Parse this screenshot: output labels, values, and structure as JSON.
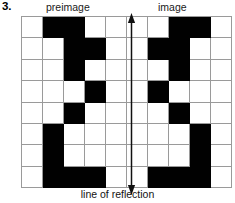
{
  "header": {
    "problem_number": "3.",
    "left_label": "preimage",
    "right_label": "image"
  },
  "caption": "line of reflection",
  "colors": {
    "filled_cell": "#010101",
    "empty_cell": "#ffffff",
    "grid_line": "#9a9a9a",
    "axis_line": "#111111",
    "background": "#ffffff"
  },
  "axis": {
    "orientation": "vertical",
    "double_headed": true,
    "position_between_columns": [
      5,
      6
    ]
  },
  "chart_data": {
    "type": "heatmap",
    "title": "line of reflection",
    "xlabel": "",
    "ylabel": "",
    "columns": 10,
    "rows": 8,
    "legend": [
      "preimage",
      "image"
    ],
    "annotations": [
      "preimage",
      "image",
      "line of reflection"
    ],
    "grid": true,
    "value_map": {
      "0": "empty",
      "1": "filled"
    },
    "values": [
      [
        0,
        1,
        1,
        0,
        0,
        0,
        0,
        1,
        1,
        0
      ],
      [
        0,
        0,
        1,
        1,
        0,
        0,
        1,
        1,
        0,
        0
      ],
      [
        0,
        0,
        1,
        0,
        0,
        0,
        0,
        1,
        0,
        0
      ],
      [
        0,
        0,
        0,
        1,
        0,
        0,
        1,
        0,
        0,
        0
      ],
      [
        0,
        0,
        1,
        0,
        0,
        0,
        0,
        1,
        0,
        0
      ],
      [
        0,
        1,
        0,
        0,
        0,
        0,
        0,
        0,
        1,
        0
      ],
      [
        0,
        1,
        0,
        0,
        0,
        0,
        0,
        0,
        1,
        0
      ],
      [
        0,
        1,
        1,
        1,
        0,
        0,
        1,
        1,
        1,
        0
      ]
    ],
    "preimage_filled_cells": [
      {
        "row": 1,
        "cols": [
          2,
          3
        ]
      },
      {
        "row": 2,
        "cols": [
          3,
          4
        ]
      },
      {
        "row": 3,
        "cols": [
          3
        ]
      },
      {
        "row": 4,
        "cols": [
          4
        ]
      },
      {
        "row": 5,
        "cols": [
          3
        ]
      },
      {
        "row": 6,
        "cols": [
          2
        ]
      },
      {
        "row": 7,
        "cols": [
          2
        ]
      },
      {
        "row": 8,
        "cols": [
          2,
          3,
          4
        ]
      }
    ],
    "image_filled_cells": [
      {
        "row": 1,
        "cols": [
          8,
          9
        ]
      },
      {
        "row": 2,
        "cols": [
          7,
          8
        ]
      },
      {
        "row": 3,
        "cols": [
          8
        ]
      },
      {
        "row": 4,
        "cols": [
          7
        ]
      },
      {
        "row": 5,
        "cols": [
          8
        ]
      },
      {
        "row": 6,
        "cols": [
          9
        ]
      },
      {
        "row": 7,
        "cols": [
          9
        ]
      },
      {
        "row": 8,
        "cols": [
          7,
          8,
          9
        ]
      }
    ]
  }
}
